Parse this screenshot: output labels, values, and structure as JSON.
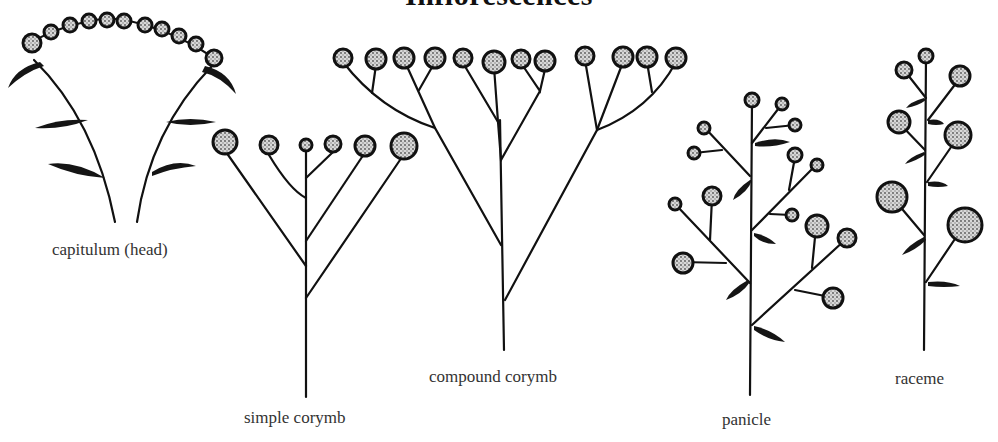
{
  "title": "Inflorescences",
  "colors": {
    "ink": "#111111",
    "label": "#333333",
    "background": "#ffffff"
  },
  "diagrams": [
    {
      "id": "capitulum",
      "label": "capitulum (head)"
    },
    {
      "id": "simple-corymb",
      "label": "simple corymb"
    },
    {
      "id": "compound-corymb",
      "label": "compound corymb"
    },
    {
      "id": "panicle",
      "label": "panicle"
    },
    {
      "id": "raceme",
      "label": "raceme"
    }
  ]
}
